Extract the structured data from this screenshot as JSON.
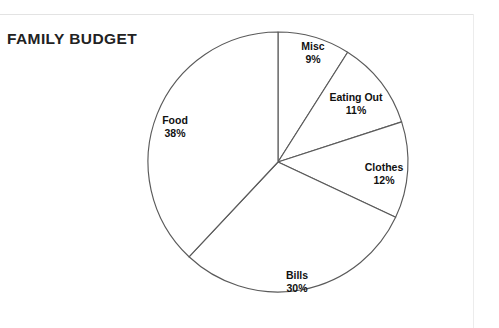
{
  "page": {
    "background_color": "#ffffff",
    "rule_color": "#e3e3e3"
  },
  "chart_title": "FAMILY BUDGET",
  "chart_data": {
    "type": "pie",
    "title": "FAMILY BUDGET",
    "xlabel": "",
    "ylabel": "",
    "legend_position": "none",
    "grid": false,
    "labels_inside": true,
    "start_angle_deg": 0,
    "direction": "clockwise",
    "slice_fill_color": "#ffffff",
    "slice_stroke_color": "#5a5a5a",
    "categories": [
      "Misc",
      "Eating Out",
      "Clothes",
      "Bills",
      "Food"
    ],
    "values": [
      9,
      11,
      12,
      30,
      38
    ],
    "value_labels": [
      "9%",
      "11%",
      "12%",
      "30%",
      "38%"
    ],
    "total": 100,
    "unit": "%",
    "slices": [
      {
        "name": "Misc",
        "value": 9,
        "label": "9%",
        "start_deg": 0.0,
        "end_deg": 32.4,
        "label_x": 313,
        "label_y": 53
      },
      {
        "name": "Eating Out",
        "value": 11,
        "label": "11%",
        "start_deg": 32.4,
        "end_deg": 72.0,
        "label_x": 356,
        "label_y": 104
      },
      {
        "name": "Clothes",
        "value": 12,
        "label": "12%",
        "start_deg": 72.0,
        "end_deg": 115.2,
        "label_x": 384,
        "label_y": 174
      },
      {
        "name": "Bills",
        "value": 30,
        "label": "30%",
        "start_deg": 115.2,
        "end_deg": 223.2,
        "label_x": 297,
        "label_y": 282
      },
      {
        "name": "Food",
        "value": 38,
        "label": "38%",
        "start_deg": 223.2,
        "end_deg": 360.0,
        "label_x": 175,
        "label_y": 127
      }
    ],
    "geometry": {
      "center_x": 278,
      "center_y": 162,
      "radius": 130
    }
  }
}
